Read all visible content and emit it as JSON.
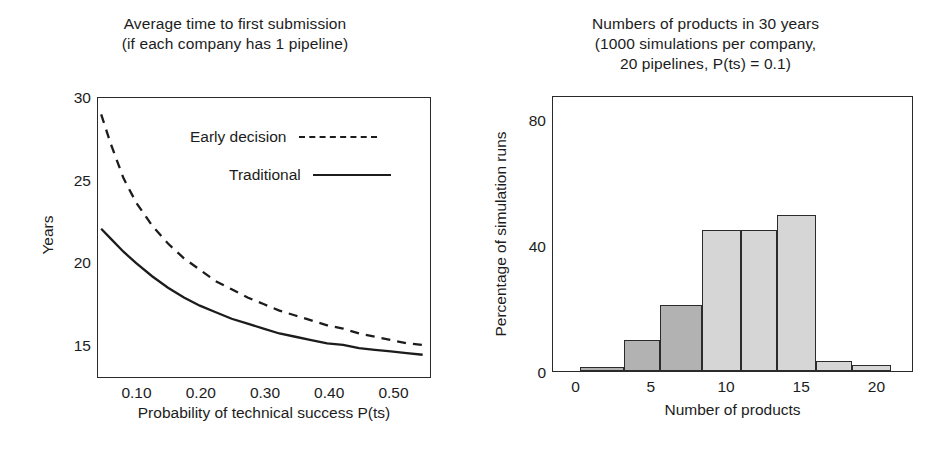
{
  "figure": {
    "background": "#ffffff",
    "ink": "#1c1c1c"
  },
  "left_panel": {
    "title_line1": "Average time to first submission",
    "title_line2": "(if each company has 1 pipeline)",
    "xlabel_line1": "Probability of technical success",
    "xlabel_line2": "P(ts)",
    "ylabel": "Years",
    "legend": [
      {
        "label": "Early decision",
        "style": "dashed"
      },
      {
        "label": "Traditional",
        "style": "solid"
      }
    ]
  },
  "right_panel": {
    "title_line1": "Numbers of products in 30 years",
    "title_line2": "(1000 simulations per company,",
    "title_line3": "20 pipelines, P(ts) = 0.1)",
    "xlabel": "Number of products",
    "ylabel": "Percentage of simulation runs"
  },
  "chart_data": [
    {
      "type": "line",
      "title": "Average time to first submission (if each company has 1 pipeline)",
      "xlabel": "Probability of technical success P(ts)",
      "ylabel": "Years",
      "xlim": [
        0.04,
        0.56
      ],
      "ylim": [
        13.0,
        30.0
      ],
      "xticks": [
        0.1,
        0.2,
        0.3,
        0.4,
        0.5
      ],
      "xticklabels": [
        "0.10",
        "0.20",
        "0.30",
        "0.40",
        "0.50"
      ],
      "yticks": [
        15,
        20,
        25,
        30
      ],
      "yticklabels": [
        "15",
        "20",
        "25",
        "30"
      ],
      "grid": false,
      "legend_position": "upper right inside",
      "series": [
        {
          "name": "Early decision",
          "style": "dashed",
          "color": "#1c1c1c",
          "x": [
            0.045,
            0.06,
            0.08,
            0.1,
            0.125,
            0.15,
            0.175,
            0.2,
            0.225,
            0.25,
            0.275,
            0.3,
            0.325,
            0.35,
            0.375,
            0.4,
            0.425,
            0.45,
            0.475,
            0.5,
            0.525,
            0.55
          ],
          "y": [
            29.0,
            27.2,
            25.1,
            23.6,
            22.2,
            21.1,
            20.2,
            19.5,
            18.8,
            18.3,
            17.8,
            17.4,
            17.0,
            16.7,
            16.4,
            16.1,
            15.9,
            15.6,
            15.4,
            15.2,
            15.0,
            14.9
          ]
        },
        {
          "name": "Traditional",
          "style": "solid",
          "color": "#1c1c1c",
          "x": [
            0.045,
            0.06,
            0.08,
            0.1,
            0.125,
            0.15,
            0.175,
            0.2,
            0.225,
            0.25,
            0.275,
            0.3,
            0.325,
            0.35,
            0.375,
            0.4,
            0.425,
            0.45,
            0.475,
            0.5,
            0.525,
            0.55
          ],
          "y": [
            22.0,
            21.4,
            20.6,
            19.9,
            19.1,
            18.4,
            17.8,
            17.3,
            16.9,
            16.5,
            16.2,
            15.9,
            15.6,
            15.4,
            15.2,
            15.0,
            14.9,
            14.7,
            14.6,
            14.5,
            14.4,
            14.3
          ]
        }
      ]
    },
    {
      "type": "bar",
      "title": "Numbers of products in 30 years (1000 simulations per company, 20 pipelines, P(ts) = 0.1)",
      "xlabel": "Number of products",
      "ylabel": "Percentage of simulation runs",
      "xlim": [
        -1.5,
        22.5
      ],
      "ylim": [
        0,
        92
      ],
      "xticks": [
        0,
        5,
        10,
        15,
        20
      ],
      "xticklabels": [
        "0",
        "5",
        "10",
        "15",
        "20"
      ],
      "yticks": [
        0,
        40,
        80
      ],
      "yticklabels": [
        "0",
        "40",
        "80"
      ],
      "grid": false,
      "histogram": true,
      "series": [
        {
          "name": "Traditional",
          "color": "#b2b2b2",
          "bin_edges": [
            0.3,
            3.2,
            5.6,
            8.4,
            11.0,
            13.4,
            16.0,
            18.4,
            21.0
          ],
          "bin_centers": [
            1.75,
            4.4,
            7.0,
            9.7,
            12.2,
            14.7,
            17.2,
            19.7
          ],
          "values": [
            1.0,
            10.5,
            22.0,
            47.0,
            13.0,
            2.5,
            1.0,
            0.0
          ]
        },
        {
          "name": "Early decision",
          "color": "#d6d6d6",
          "bin_edges": [
            8.4,
            11.0,
            13.4,
            16.0,
            18.4,
            21.0
          ],
          "bin_centers": [
            9.7,
            12.2,
            14.7,
            17.2,
            19.7
          ],
          "values": [
            47.0,
            47.0,
            52.0,
            3.5,
            2.0
          ]
        }
      ]
    }
  ]
}
